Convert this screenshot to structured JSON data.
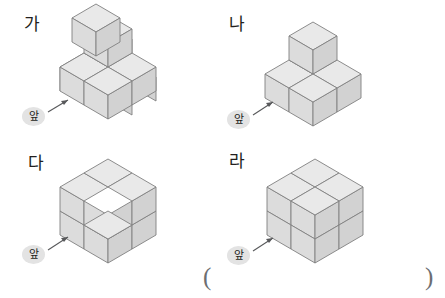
{
  "page": {
    "background_color": "#ffffff",
    "ink_color": "#231f20"
  },
  "figures": [
    {
      "id": "ga",
      "label": "가",
      "front_label": "앞",
      "cube_count": 6,
      "description": "Six unit cubes: 2x2 base layer with two cubes stacked on the back-left column",
      "face_colors": {
        "top": "#e9e9e9",
        "left": "#dcdcdc",
        "right": "#d2d2d2",
        "outline": "#808080"
      }
    },
    {
      "id": "na",
      "label": "나",
      "front_label": "앞",
      "cube_count": 4,
      "description": "Four unit cubes: three-cube L-shaped base with one cube on the back corner",
      "face_colors": {
        "top": "#e9e9e9",
        "left": "#dcdcdc",
        "right": "#d2d2d2",
        "outline": "#808080"
      }
    },
    {
      "id": "da",
      "label": "다",
      "front_label": "앞",
      "cube_count": 7,
      "description": "Seven unit cubes: a 2x2x2 cube with the top front-left cube removed",
      "face_colors": {
        "top": "#e9e9e9",
        "left": "#dcdcdc",
        "right": "#d2d2d2",
        "outline": "#808080"
      }
    },
    {
      "id": "ra",
      "label": "라",
      "front_label": "앞",
      "cube_count": 8,
      "description": "Eight unit cubes forming a complete 2x2x2 cube",
      "face_colors": {
        "top": "#e9e9e9",
        "left": "#dcdcdc",
        "right": "#d2d2d2",
        "outline": "#808080"
      }
    }
  ],
  "answer": {
    "open_paren": "(",
    "close_paren": ")",
    "value": ""
  }
}
